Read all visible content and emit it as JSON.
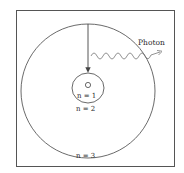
{
  "diagram": {
    "type": "bohr-model-emission",
    "frame": {
      "color": "#555555"
    },
    "orbits": [
      {
        "n": 1,
        "label": "n = 1"
      },
      {
        "n": 2,
        "label": "n = 2"
      },
      {
        "n": 3,
        "label": "n = 3"
      }
    ],
    "nucleus": {
      "label": ""
    },
    "transition": {
      "from": 3,
      "to": 1,
      "arrow": "down"
    },
    "photon": {
      "label": "Photon"
    },
    "colors": {
      "line": "#444444",
      "text": "#2a2a2a",
      "background": "#ffffff"
    }
  }
}
